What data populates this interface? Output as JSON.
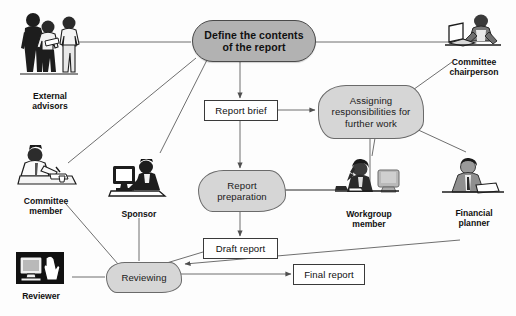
{
  "diagram": {
    "colors": {
      "process_fill": "#b2b2b2",
      "cloud_fill": "#d6d6d6",
      "doc_fill": "#ffffff",
      "line": "#6b6b6b",
      "text": "#101010",
      "background": "#fdfdfd"
    },
    "nodes": [
      {
        "id": "define",
        "type": "rounded",
        "label": "Define the contents\nof the report",
        "x": 192,
        "y": 20,
        "w": 122,
        "h": 40
      },
      {
        "id": "report_brief",
        "type": "doc",
        "label": "Report brief",
        "x": 204,
        "y": 100,
        "w": 72,
        "h": 19
      },
      {
        "id": "assigning",
        "type": "cloud",
        "label": "Assigning\nresponsibilities for\nfurther work",
        "x": 318,
        "y": 85,
        "w": 104,
        "h": 52
      },
      {
        "id": "report_prep",
        "type": "cloud",
        "label": "Report\npreparation",
        "x": 198,
        "y": 170,
        "w": 86,
        "h": 40
      },
      {
        "id": "draft_report",
        "type": "doc",
        "label": "Draft report",
        "x": 203,
        "y": 238,
        "w": 73,
        "h": 19
      },
      {
        "id": "reviewing",
        "type": "cloud",
        "label": "Reviewing",
        "x": 106,
        "y": 262,
        "w": 74,
        "h": 29
      },
      {
        "id": "final_report",
        "type": "doc",
        "label": "Final report",
        "x": 293,
        "y": 264,
        "w": 70,
        "h": 19
      }
    ],
    "actors": [
      {
        "id": "external_advisors",
        "label": "External\nadvisors",
        "x": 12,
        "y": 8,
        "w": 76,
        "h": 82,
        "art": "group-of-three-people-icon"
      },
      {
        "id": "committee_chairperson",
        "label": "Committee\nchairperson",
        "x": 443,
        "y": 12,
        "w": 62,
        "h": 48,
        "art": "person-at-desk-with-laptop-icon"
      },
      {
        "id": "committee_member",
        "label": "Committee\nmember",
        "x": 12,
        "y": 143,
        "w": 68,
        "h": 54,
        "art": "person-writing-at-desk-icon"
      },
      {
        "id": "sponsor",
        "label": "Sponsor",
        "x": 108,
        "y": 158,
        "w": 62,
        "h": 50,
        "art": "person-with-desktop-computer-icon"
      },
      {
        "id": "workgroup_member",
        "label": "Workgroup\nmember",
        "x": 333,
        "y": 158,
        "w": 72,
        "h": 52,
        "art": "woman-on-phone-with-monitor-icon"
      },
      {
        "id": "financial_planner",
        "label": "Financial\nplanner",
        "x": 440,
        "y": 155,
        "w": 68,
        "h": 54,
        "art": "man-in-suit-at-desk-icon"
      },
      {
        "id": "reviewer",
        "label": "Reviewer",
        "x": 12,
        "y": 252,
        "w": 58,
        "h": 44,
        "art": "monitor-with-hand-icon"
      }
    ],
    "connections": [
      {
        "from": "external_advisors",
        "to": "define",
        "arrow": false
      },
      {
        "from": "committee_chairperson",
        "to": "define",
        "arrow": false
      },
      {
        "from": "define",
        "to": "report_brief",
        "arrow": true
      },
      {
        "from": "report_brief",
        "to": "assigning",
        "arrow": true
      },
      {
        "from": "report_brief",
        "to": "report_prep",
        "arrow": true
      },
      {
        "from": "define",
        "to": "committee_member",
        "arrow": false
      },
      {
        "from": "define",
        "to": "sponsor",
        "arrow": false
      },
      {
        "from": "committee_chairperson",
        "to": "assigning",
        "arrow": false
      },
      {
        "from": "financial_planner",
        "to": "assigning",
        "arrow": false
      },
      {
        "from": "workgroup_member",
        "to": "assigning",
        "arrow": false
      },
      {
        "from": "assigning",
        "to": "report_prep",
        "arrow": false
      },
      {
        "from": "workgroup_member",
        "to": "report_prep",
        "arrow": false
      },
      {
        "from": "report_prep",
        "to": "draft_report",
        "arrow": true
      },
      {
        "from": "draft_report",
        "to": "reviewing",
        "arrow": true
      },
      {
        "from": "committee_member",
        "to": "reviewing",
        "arrow": false
      },
      {
        "from": "sponsor",
        "to": "reviewing",
        "arrow": false
      },
      {
        "from": "reviewer",
        "to": "reviewing",
        "arrow": false
      },
      {
        "from": "financial_planner",
        "to": "reviewing",
        "arrow": true
      },
      {
        "from": "reviewing",
        "to": "final_report",
        "arrow": true
      }
    ]
  }
}
